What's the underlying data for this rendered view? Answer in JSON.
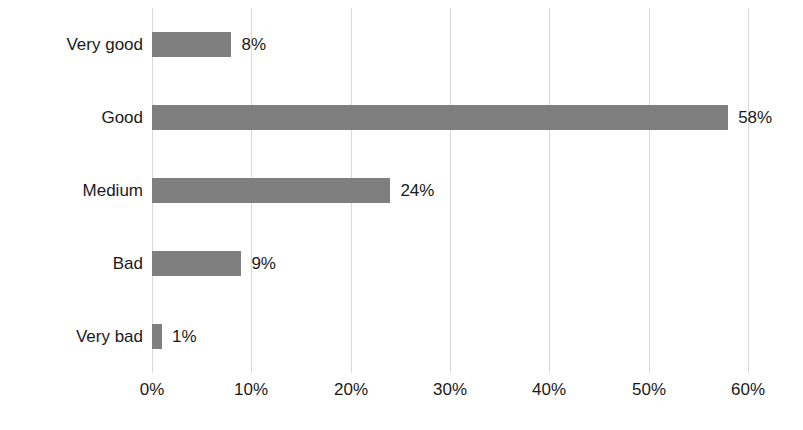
{
  "chart_data": {
    "type": "bar",
    "orientation": "horizontal",
    "title": "",
    "subtitle": "",
    "xlabel": "",
    "ylabel": "",
    "categories": [
      "Very good",
      "Good",
      "Medium",
      "Bad",
      "Very bad"
    ],
    "values": [
      8,
      58,
      24,
      9,
      1
    ],
    "value_labels": [
      "8%",
      "58%",
      "24%",
      "9%",
      "1%"
    ],
    "xlim": [
      0,
      60
    ],
    "xticks": [
      0,
      10,
      20,
      30,
      40,
      50,
      60
    ],
    "xtick_labels": [
      "0%",
      "10%",
      "20%",
      "30%",
      "40%",
      "50%",
      "60%"
    ],
    "grid": true,
    "grid_axis": "x",
    "legend": false,
    "legend_position": "none",
    "series": [
      {
        "name": "",
        "values": [
          8,
          58,
          24,
          9,
          1
        ]
      }
    ],
    "colors": {
      "bar_fill": "#7f7f7f",
      "gridline": "#d9d9d9",
      "text": "#1a1a1a",
      "background": "#ffffff"
    }
  }
}
